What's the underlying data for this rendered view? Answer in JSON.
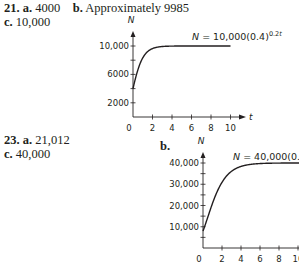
{
  "problems": [
    {
      "number": "21.",
      "parts": [
        {
          "label": "a.",
          "value": "4000"
        },
        {
          "label": "b.",
          "value": "Approximately 9985"
        },
        {
          "label": "c.",
          "value": "10,000"
        }
      ]
    },
    {
      "number": "23.",
      "parts": [
        {
          "label": "a.",
          "value": "21,012"
        },
        {
          "label": "c.",
          "value": "40,000"
        }
      ],
      "graph_label": "b."
    }
  ],
  "chart_data": [
    {
      "type": "line",
      "title": "",
      "equation": {
        "lhs": "N",
        "rhs": "10,000(0.4)",
        "exponent": "0.2t"
      },
      "xlabel": "t",
      "ylabel": "N",
      "xlim": [
        0,
        11
      ],
      "ylim": [
        0,
        11000
      ],
      "xticks": [
        2,
        4,
        6,
        8,
        10
      ],
      "xtick_labels": [
        "0",
        "2",
        "4",
        "6",
        "8",
        "10"
      ],
      "yticks": [
        2000,
        4000,
        6000,
        8000,
        10000
      ],
      "ytick_labels": [
        "2000",
        "6000",
        "10,000"
      ],
      "ytick_labeled_values": [
        2000,
        6000,
        10000
      ],
      "grid": false,
      "series": [
        {
          "name": "N = 10,000(0.4)^(0.2^t)",
          "base": 10000,
          "a": 0.4,
          "b": 0.2,
          "x": [
            0,
            0.5,
            1,
            1.5,
            2,
            3,
            4,
            6,
            8,
            10
          ],
          "y": [
            4000,
            5197,
            6325,
            7248,
            7934,
            8850,
            9640,
            9985,
            9999,
            10000
          ]
        }
      ]
    },
    {
      "type": "line",
      "title": "",
      "equation": {
        "lhs": "N",
        "rhs": "40,000(0.2)",
        "exponent": "0.4t"
      },
      "xlabel": "",
      "ylabel": "N",
      "xlim": [
        0,
        10.5
      ],
      "ylim": [
        0,
        43000
      ],
      "xticks": [
        2,
        4,
        6,
        8,
        10
      ],
      "xtick_labels": [
        "0",
        "2",
        "4",
        "6",
        "8",
        "10"
      ],
      "yticks": [
        5000,
        10000,
        15000,
        20000,
        25000,
        30000,
        35000,
        40000
      ],
      "ytick_labels": [
        "10,000",
        "20,000",
        "30,000",
        "40,000"
      ],
      "ytick_labeled_values": [
        10000,
        20000,
        30000,
        40000
      ],
      "grid": false,
      "series": [
        {
          "name": "N = 40,000(0.2)^(0.4^t)",
          "base": 40000,
          "a": 0.2,
          "b": 0.4,
          "x": [
            0,
            1,
            2,
            3,
            4,
            6,
            8,
            10
          ],
          "y": [
            8000,
            21012,
            30900,
            36300,
            38800,
            39900,
            40000,
            40000
          ]
        }
      ]
    }
  ]
}
